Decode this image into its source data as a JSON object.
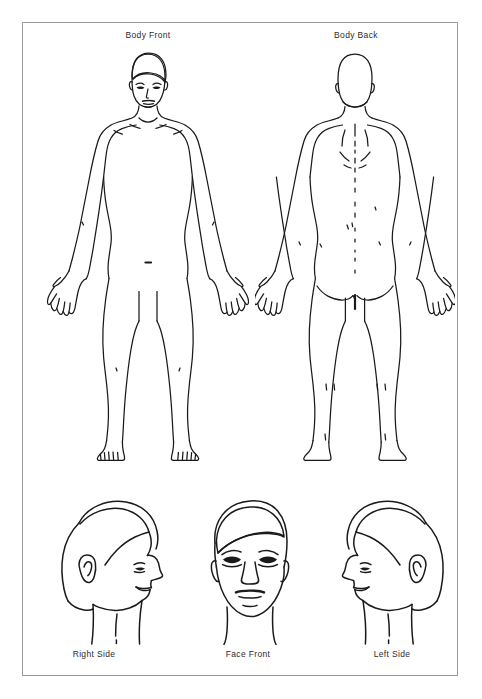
{
  "page": {
    "corner_mark": "",
    "background_color": "#ffffff",
    "frame_color": "#9b9b9b",
    "ink_color": "#1a1a1a"
  },
  "figures": [
    {
      "id": "body-front",
      "label": "Body Front",
      "view": "anterior full body",
      "label_x": 148,
      "label_y": 30
    },
    {
      "id": "body-back",
      "label": "Body Back",
      "view": "posterior full body",
      "label_x": 356,
      "label_y": 30
    },
    {
      "id": "head-right-side",
      "label": "Right Side",
      "view": "right profile head",
      "label_x": 94,
      "label_y": 651
    },
    {
      "id": "head-face-front",
      "label": "Face Front",
      "view": "anterior head",
      "label_x": 248,
      "label_y": 651
    },
    {
      "id": "head-left-side",
      "label": "Left Side",
      "view": "left profile head",
      "label_x": 392,
      "label_y": 651
    }
  ]
}
